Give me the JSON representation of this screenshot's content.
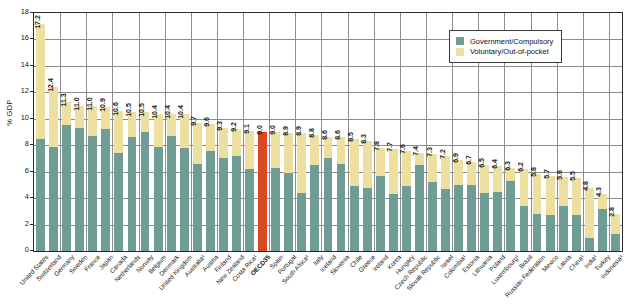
{
  "chart_data": {
    "type": "bar",
    "title": "",
    "subtitle": "",
    "xlabel": "",
    "ylabel": "% GDP",
    "ylim": [
      0,
      18
    ],
    "yticks": [
      0,
      2,
      4,
      6,
      8,
      10,
      12,
      14,
      16,
      18
    ],
    "ytick_labels": [
      "0",
      "2",
      "4",
      "6",
      "8",
      "10",
      "12",
      "14",
      "16",
      "18"
    ],
    "grid": true,
    "stacked": true,
    "legend_position": "top-right",
    "legend": [
      {
        "label": "Government/Compulsory",
        "color": "#6f9d95"
      },
      {
        "label": "Voluntary/Out-of-pocket",
        "color": "#ecdf9f"
      }
    ],
    "colors": {
      "government": "#6f9d95",
      "voluntary": "#ecdf9f",
      "highlight": "#d8491f",
      "grid": "#8d8d8d",
      "frame": "#2a2a2a",
      "background": "#ffffff",
      "text": "#1a1a1a"
    },
    "highlight_category": "OECD35",
    "categories": [
      "United States",
      "Switzerland",
      "Germany",
      "Sweden",
      "France",
      "Japan",
      "Canada",
      "Netherlands",
      "Norway",
      "Belgium",
      "Denmark",
      "United Kingdom",
      "Australia¹",
      "Austria",
      "Finland",
      "New Zealand",
      "Costa Rica¹",
      "OECD35",
      "Spain",
      "Portugal",
      "South Africa¹",
      "Italy",
      "Iceland",
      "Slovenia",
      "Chile",
      "Greece",
      "Ireland",
      "Korea",
      "Hungary",
      "Czech Republic",
      "Slovak Republic",
      "Israel",
      "Colombia¹",
      "Estonia",
      "Lithuania",
      "Poland",
      "Luxembourg¹",
      "Brazil",
      "Russian Federation",
      "Mexico",
      "Latvia",
      "China¹",
      "India¹",
      "Turkey",
      "Indonesia¹"
    ],
    "totals": [
      17.2,
      12.4,
      11.3,
      11.0,
      11.0,
      10.9,
      10.6,
      10.5,
      10.5,
      10.4,
      10.4,
      10.4,
      9.7,
      9.6,
      9.3,
      9.2,
      9.1,
      9.0,
      9.0,
      8.9,
      8.9,
      8.8,
      8.6,
      8.6,
      8.5,
      8.3,
      7.8,
      7.7,
      7.6,
      7.4,
      7.3,
      7.2,
      6.9,
      6.7,
      6.5,
      6.4,
      6.3,
      6.2,
      5.8,
      5.7,
      5.6,
      5.5,
      4.8,
      4.3,
      2.8
    ],
    "series": [
      {
        "name": "Government/Compulsory",
        "color": "#6f9d95",
        "values": [
          8.5,
          7.9,
          9.5,
          9.3,
          8.7,
          9.2,
          7.4,
          8.6,
          9.0,
          7.9,
          8.7,
          7.8,
          6.6,
          7.6,
          7.0,
          7.2,
          6.2,
          9.0,
          6.3,
          5.9,
          4.4,
          6.5,
          7.0,
          6.6,
          4.9,
          4.8,
          5.7,
          4.3,
          4.9,
          6.5,
          5.2,
          4.7,
          5.0,
          5.0,
          4.4,
          4.5,
          5.3,
          3.4,
          2.8,
          2.7,
          3.4,
          2.7,
          1.0,
          3.2,
          1.3
        ]
      },
      {
        "name": "Voluntary/Out-of-pocket",
        "color": "#ecdf9f",
        "values": [
          8.7,
          4.5,
          1.8,
          1.7,
          2.3,
          1.7,
          3.2,
          1.9,
          1.5,
          2.5,
          1.7,
          2.6,
          3.1,
          2.0,
          2.3,
          2.0,
          2.9,
          0.0,
          2.7,
          3.0,
          4.5,
          2.3,
          1.6,
          2.0,
          3.6,
          3.5,
          2.1,
          3.4,
          2.7,
          0.9,
          2.1,
          2.5,
          1.9,
          1.7,
          2.1,
          1.9,
          1.0,
          2.8,
          3.0,
          3.0,
          2.2,
          2.8,
          3.8,
          1.1,
          1.5
        ]
      }
    ],
    "data_labels": [
      "17.2",
      "12.4",
      "11.3",
      "11.0",
      "11.0",
      "10.9",
      "10.6",
      "10.5",
      "10.5",
      "10.4",
      "10.4",
      "10.4",
      "9.7",
      "9.6",
      "9.3",
      "9.2",
      "9.1",
      "9.0",
      "9.0",
      "8.9",
      "8.9",
      "8.8",
      "8.6",
      "8.6",
      "8.5",
      "8.3",
      "7.8",
      "7.7",
      "7.6",
      "7.4",
      "7.3",
      "7.2",
      "6.9",
      "6.7",
      "6.5",
      "6.4",
      "6.3",
      "6.2",
      "5.8",
      "5.7",
      "5.6",
      "5.5",
      "4.8",
      "4.3",
      "2.8"
    ]
  }
}
